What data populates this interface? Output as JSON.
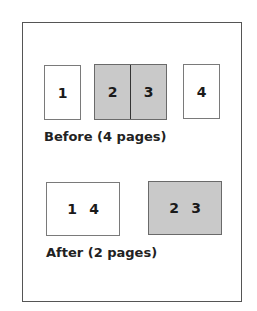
{
  "before": {
    "caption": "Before (4 pages)",
    "pages": [
      {
        "label": "1",
        "shaded": false
      },
      {
        "label": "2",
        "shaded": true
      },
      {
        "label": "3",
        "shaded": true
      },
      {
        "label": "4",
        "shaded": false
      }
    ]
  },
  "after": {
    "caption": "After (2 pages)",
    "sheets": [
      {
        "labels": [
          "1",
          "4"
        ],
        "shaded": false
      },
      {
        "labels": [
          "2",
          "3"
        ],
        "shaded": true
      }
    ]
  },
  "colors": {
    "shaded_fill": "#c9c9c9",
    "border": "#555555",
    "text": "#1a1a1a"
  }
}
